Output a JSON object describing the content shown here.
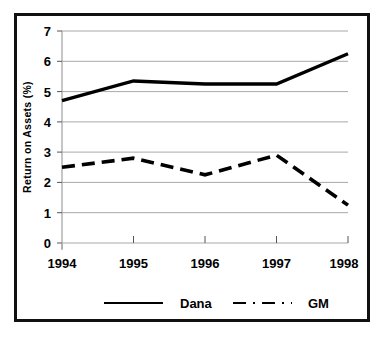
{
  "chart_data": {
    "type": "line",
    "title": "",
    "xlabel": "",
    "ylabel": "Return on Assets (%)",
    "categories": [
      "1994",
      "1995",
      "1996",
      "1997",
      "1998"
    ],
    "x": [
      1994,
      1995,
      1996,
      1997,
      1998
    ],
    "xlim": [
      1994,
      1998
    ],
    "ylim": [
      0,
      7
    ],
    "yticks": [
      "0",
      "1",
      "2",
      "3",
      "4",
      "5",
      "6",
      "7"
    ],
    "ytick_values": [
      0,
      1,
      2,
      3,
      4,
      5,
      6,
      7
    ],
    "grid": true,
    "grid_axis": "y",
    "legend_position": "bottom",
    "series": [
      {
        "name": "Dana",
        "style": "solid",
        "color": "#000000",
        "values": [
          4.7,
          5.35,
          5.25,
          5.25,
          6.25
        ]
      },
      {
        "name": "GM",
        "style": "dashed",
        "color": "#000000",
        "values": [
          2.5,
          2.8,
          2.25,
          2.9,
          1.25
        ]
      }
    ]
  },
  "axes": {
    "y_axis_title": "Return on Assets (%)",
    "y_tick_0": "0",
    "y_tick_1": "1",
    "y_tick_2": "2",
    "y_tick_3": "3",
    "y_tick_4": "4",
    "y_tick_5": "5",
    "y_tick_6": "6",
    "y_tick_7": "7",
    "x_tick_0": "1994",
    "x_tick_1": "1995",
    "x_tick_2": "1996",
    "x_tick_3": "1997",
    "x_tick_4": "1998"
  },
  "legend": {
    "item_dana": "Dana",
    "item_gm": "GM"
  },
  "colors": {
    "line": "#000000",
    "grid": "#a8a8a8",
    "frame": "#111111",
    "background": "#ffffff"
  }
}
